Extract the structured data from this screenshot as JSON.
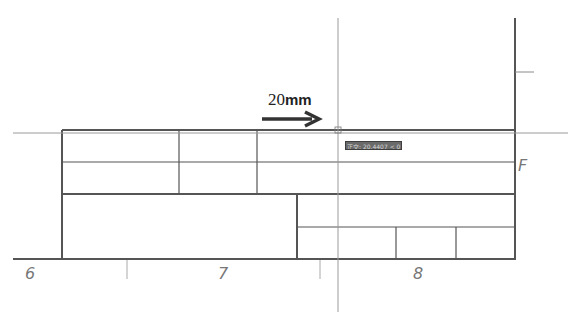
{
  "drawing": {
    "dimension_label": {
      "value": "20",
      "unit": "mm"
    },
    "direction_arrow": "right-arrow",
    "zone_labels": {
      "bottom": [
        "6",
        "7",
        "8"
      ],
      "right": "F"
    },
    "tooltip": {
      "text": "正交: 20.4407 < 0°"
    },
    "colors": {
      "frame": "#555555",
      "crosshair": "#9a9a9a",
      "tooltip_bg": "#6a6a6a",
      "background": "#ffffff"
    }
  }
}
